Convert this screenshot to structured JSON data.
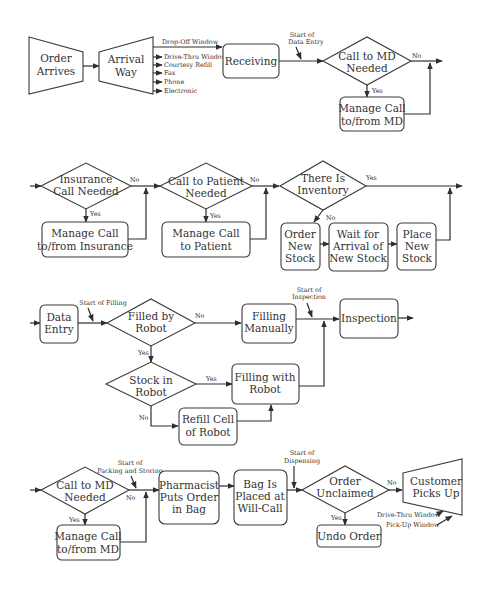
{
  "diagram": {
    "type": "flowchart",
    "rows": [
      {
        "id": "row1",
        "nodes": [
          {
            "id": "order_arrives",
            "shape": "trapezoid",
            "lines": [
              "Order",
              "Arrives"
            ]
          },
          {
            "id": "arrival_way",
            "shape": "trapezoid",
            "lines": [
              "Arrival",
              "Way"
            ]
          },
          {
            "id": "receiving",
            "shape": "rounded-rect",
            "lines": [
              "Receiving"
            ]
          },
          {
            "id": "call_md_1",
            "shape": "diamond",
            "lines": [
              "Call to MD",
              "Needed"
            ]
          },
          {
            "id": "manage_md_1",
            "shape": "rounded-rect",
            "lines": [
              "Manage Call",
              "to/from MD"
            ]
          }
        ],
        "arrival_ways": [
          "Drop-Off Window",
          "Drive-Thru Window",
          "Courtesy Refill",
          "Fax",
          "Phone",
          "Electronic"
        ],
        "annotations": [
          "Start of",
          "Data Entry"
        ]
      },
      {
        "id": "row2",
        "nodes": [
          {
            "id": "insurance_call",
            "shape": "diamond",
            "lines": [
              "Insurance",
              "Call Needed"
            ]
          },
          {
            "id": "manage_insurance",
            "shape": "rounded-rect",
            "lines": [
              "Manage Call",
              "to/from Insurance"
            ]
          },
          {
            "id": "call_patient",
            "shape": "diamond",
            "lines": [
              "Call to Patient",
              "Needed"
            ]
          },
          {
            "id": "manage_patient",
            "shape": "rounded-rect",
            "lines": [
              "Manage Call",
              "to Patient"
            ]
          },
          {
            "id": "inventory",
            "shape": "diamond",
            "lines": [
              "There Is",
              "Inventory"
            ]
          },
          {
            "id": "order_stock",
            "shape": "rounded-rect",
            "lines": [
              "Order",
              "New",
              "Stock"
            ]
          },
          {
            "id": "wait_stock",
            "shape": "rounded-rect",
            "lines": [
              "Wait for",
              "Arrival of",
              "New Stock"
            ]
          },
          {
            "id": "place_stock",
            "shape": "rounded-rect",
            "lines": [
              "Place",
              "New",
              "Stock"
            ]
          }
        ]
      },
      {
        "id": "row3",
        "nodes": [
          {
            "id": "data_entry",
            "shape": "rounded-rect",
            "lines": [
              "Data",
              "Entry"
            ]
          },
          {
            "id": "filled_robot",
            "shape": "diamond",
            "lines": [
              "Filled by",
              "Robot"
            ]
          },
          {
            "id": "filling_manual",
            "shape": "rounded-rect",
            "lines": [
              "Filling",
              "Manually"
            ]
          },
          {
            "id": "inspection",
            "shape": "rounded-rect",
            "lines": [
              "Inspection"
            ]
          },
          {
            "id": "stock_robot",
            "shape": "diamond",
            "lines": [
              "Stock in",
              "Robot"
            ]
          },
          {
            "id": "filling_robot",
            "shape": "rounded-rect",
            "lines": [
              "Filling with",
              "Robot"
            ]
          },
          {
            "id": "refill_cell",
            "shape": "rounded-rect",
            "lines": [
              "Refill Cell",
              "of Robot"
            ]
          }
        ],
        "annotations": {
          "filling": "Start of Filling",
          "inspection": [
            "Start of",
            "Inspection"
          ]
        }
      },
      {
        "id": "row4",
        "nodes": [
          {
            "id": "call_md_2",
            "shape": "diamond",
            "lines": [
              "Call to MD",
              "Needed"
            ]
          },
          {
            "id": "manage_md_2",
            "shape": "rounded-rect",
            "lines": [
              "Manage Call",
              "to/from MD"
            ]
          },
          {
            "id": "pharmacist_bag",
            "shape": "rounded-rect",
            "lines": [
              "Pharmacist",
              "Puts Order",
              "in Bag"
            ]
          },
          {
            "id": "bag_willcall",
            "shape": "rounded-rect",
            "lines": [
              "Bag Is",
              "Placed at",
              "Will-Call"
            ]
          },
          {
            "id": "order_unclaimed",
            "shape": "diamond",
            "lines": [
              "Order",
              "Unclaimed"
            ]
          },
          {
            "id": "undo_order",
            "shape": "rounded-rect",
            "lines": [
              "Undo Order"
            ]
          },
          {
            "id": "customer_pickup",
            "shape": "trapezoid",
            "lines": [
              "Customer",
              "Picks Up"
            ]
          }
        ],
        "annotations": {
          "packing": [
            "Start of",
            "Packing and Storing"
          ],
          "dispensing": [
            "Start of",
            "Dispensing"
          ]
        },
        "pickup_ways": [
          "Drive-Thru Window",
          "Pick-Up Window"
        ]
      }
    ],
    "edge_labels": {
      "yes": "Yes",
      "no": "No"
    }
  }
}
